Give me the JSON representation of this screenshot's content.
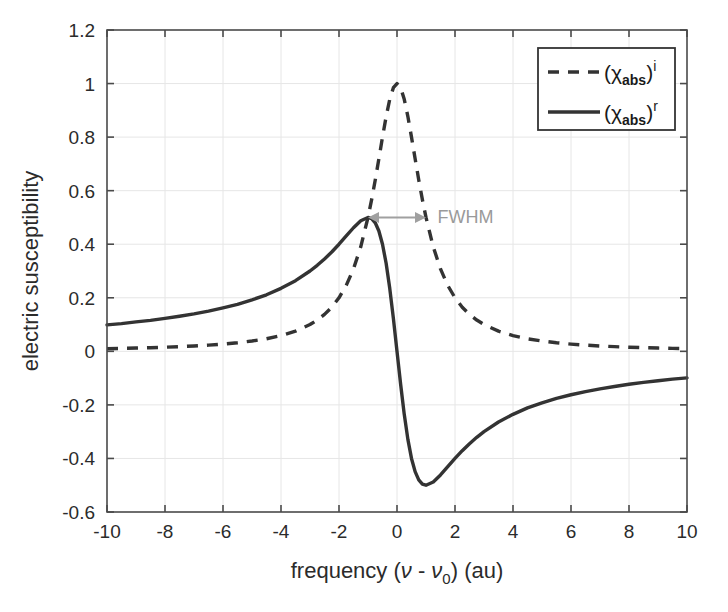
{
  "chart_data": {
    "type": "line",
    "title": "",
    "xlabel": "frequency (ν - ν₀) (au)",
    "ylabel": "electric susceptibility",
    "xlim": [
      -10,
      10
    ],
    "ylim": [
      -0.6,
      1.2
    ],
    "xticks": [
      -10,
      -8,
      -6,
      -4,
      -2,
      0,
      2,
      4,
      6,
      8,
      10
    ],
    "xtick_labels": [
      "-10",
      "-8",
      "-6",
      "-4",
      "-2",
      "0",
      "2",
      "4",
      "6",
      "8",
      "10"
    ],
    "yticks": [
      -0.6,
      -0.4,
      -0.2,
      0,
      0.2,
      0.4,
      0.6,
      0.8,
      1,
      1.2
    ],
    "ytick_labels": [
      "-0.6",
      "-0.4",
      "-0.2",
      "0",
      "0.2",
      "0.4",
      "0.6",
      "0.8",
      "1",
      "1.2"
    ],
    "grid": true,
    "legend_position": "top-right",
    "series": [
      {
        "name": "(χabs)i",
        "label_base": "(χ",
        "label_sub": "abs",
        "label_close": ")",
        "label_sup": "i",
        "style": "dashed",
        "color": "#333333",
        "formula": "1 / (1 + x^2)",
        "x": [
          -10,
          -9.5,
          -9,
          -8.5,
          -8,
          -7.5,
          -7,
          -6.5,
          -6,
          -5.5,
          -5,
          -4.5,
          -4,
          -3.5,
          -3,
          -2.75,
          -2.5,
          -2.25,
          -2,
          -1.75,
          -1.5,
          -1.25,
          -1,
          -0.875,
          -0.75,
          -0.625,
          -0.5,
          -0.375,
          -0.25,
          -0.125,
          0,
          0.125,
          0.25,
          0.375,
          0.5,
          0.625,
          0.75,
          0.875,
          1,
          1.25,
          1.5,
          1.75,
          2,
          2.25,
          2.5,
          2.75,
          3,
          3.5,
          4,
          4.5,
          5,
          5.5,
          6,
          6.5,
          7,
          7.5,
          8,
          8.5,
          9,
          9.5,
          10
        ],
        "y": [
          0.0099,
          0.0109,
          0.0122,
          0.0136,
          0.0154,
          0.0175,
          0.02,
          0.0231,
          0.027,
          0.0319,
          0.0385,
          0.0469,
          0.0588,
          0.0754,
          0.1,
          0.1168,
          0.1379,
          0.1649,
          0.2,
          0.2461,
          0.3077,
          0.3902,
          0.5,
          0.5664,
          0.64,
          0.7191,
          0.8,
          0.8767,
          0.9412,
          0.9846,
          1.0,
          0.9846,
          0.9412,
          0.8767,
          0.8,
          0.7191,
          0.64,
          0.5664,
          0.5,
          0.3902,
          0.3077,
          0.2461,
          0.2,
          0.1649,
          0.1379,
          0.1168,
          0.1,
          0.0754,
          0.0588,
          0.0469,
          0.0385,
          0.0319,
          0.027,
          0.0231,
          0.02,
          0.0175,
          0.0154,
          0.0136,
          0.0122,
          0.0109,
          0.0099
        ]
      },
      {
        "name": "(χabs)r",
        "label_base": "(χ",
        "label_sub": "abs",
        "label_close": ")",
        "label_sup": "r",
        "style": "solid",
        "color": "#333333",
        "formula": "-x / (1 + x^2)",
        "x": [
          -10,
          -9.5,
          -9,
          -8.5,
          -8,
          -7.5,
          -7,
          -6.5,
          -6,
          -5.5,
          -5,
          -4.5,
          -4,
          -3.5,
          -3,
          -2.75,
          -2.5,
          -2.25,
          -2,
          -1.75,
          -1.5,
          -1.25,
          -1,
          -0.875,
          -0.75,
          -0.625,
          -0.5,
          -0.375,
          -0.25,
          -0.125,
          0,
          0.125,
          0.25,
          0.375,
          0.5,
          0.625,
          0.75,
          0.875,
          1,
          1.25,
          1.5,
          1.75,
          2,
          2.25,
          2.5,
          2.75,
          3,
          3.5,
          4,
          4.5,
          5,
          5.5,
          6,
          6.5,
          7,
          7.5,
          8,
          8.5,
          9,
          9.5,
          10
        ],
        "y": [
          0.099,
          0.1036,
          0.1098,
          0.1157,
          0.1231,
          0.1312,
          0.14,
          0.1502,
          0.1622,
          0.1754,
          0.1923,
          0.2111,
          0.2353,
          0.2639,
          0.3,
          0.3212,
          0.3448,
          0.371,
          0.4,
          0.4308,
          0.4615,
          0.4878,
          0.5,
          0.4956,
          0.48,
          0.4494,
          0.4,
          0.3288,
          0.2353,
          0.1231,
          0.0,
          -0.1231,
          -0.2353,
          -0.3288,
          -0.4,
          -0.4494,
          -0.48,
          -0.4956,
          -0.5,
          -0.4878,
          -0.4615,
          -0.4308,
          -0.4,
          -0.371,
          -0.3448,
          -0.3212,
          -0.3,
          -0.2639,
          -0.2353,
          -0.2111,
          -0.1923,
          -0.1754,
          -0.1622,
          -0.1502,
          -0.14,
          -0.1312,
          -0.1231,
          -0.1157,
          -0.1098,
          -0.1036,
          -0.099
        ]
      }
    ],
    "annotations": [
      {
        "text": "FWHM",
        "type": "double-arrow",
        "x_start": -1,
        "x_end": 1,
        "y": 0.5,
        "color": "#a0a0a0",
        "text_x": 1.4,
        "text_y": 0.5
      }
    ]
  },
  "axes": {
    "y_title": "electric susceptibility",
    "x_title_parts": {
      "prefix": "frequency (",
      "nu": "ν",
      "minus": " - ",
      "nu0_base": "ν",
      "nu0_sub": "0",
      "suffix": ") (au)"
    }
  },
  "legend": {
    "entries": [
      {
        "style": "dashed",
        "base": "(χ",
        "sub": "abs",
        "close": ")",
        "sup": "i"
      },
      {
        "style": "solid",
        "base": "(χ",
        "sub": "abs",
        "close": ")",
        "sup": "r"
      }
    ]
  },
  "colors": {
    "curve": "#333333",
    "axis": "#4a4a4a",
    "grid": "#e6e6e6",
    "annotation": "#a0a0a0",
    "background": "#ffffff"
  }
}
